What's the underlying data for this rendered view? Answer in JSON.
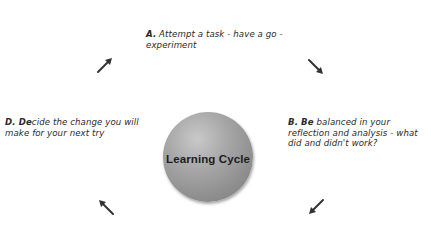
{
  "diagram": {
    "type": "cycle",
    "center": {
      "label": "Learning Cycle"
    },
    "steps": [
      {
        "id": "A",
        "letter": "A.",
        "text": " Attempt a task - have a go - experiment",
        "position": "top"
      },
      {
        "id": "B",
        "letter": "B. Be",
        "text": " balanced in your reflection and analysis - what did and didn't work?",
        "position": "right"
      },
      {
        "id": "D",
        "letter": "D. De",
        "text": "cide the change you will make for your next try",
        "position": "left"
      }
    ],
    "arrows": [
      {
        "id": "d-to-a",
        "direction": "up-right",
        "icon": "arrow-ne"
      },
      {
        "id": "a-to-b",
        "direction": "down-right",
        "icon": "arrow-se"
      },
      {
        "id": "b-to-c",
        "direction": "down-left",
        "icon": "arrow-sw"
      },
      {
        "id": "c-to-d",
        "direction": "up-left",
        "icon": "arrow-nw"
      }
    ],
    "colors": {
      "hub_fill": "#9a9a9a",
      "hub_highlight": "#c9c9c9",
      "text": "#2a2a2a",
      "arrow": "#333333",
      "background": "#ffffff"
    }
  }
}
